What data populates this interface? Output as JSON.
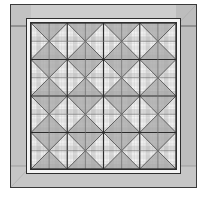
{
  "image": {
    "title": "Framed Quilt Illustration",
    "subject": "quilt-in-frame",
    "width": 207,
    "height": 200,
    "background_color": "#ffffff",
    "style": "grayscale line art"
  },
  "frame": {
    "label": "Picture Frame",
    "fill_color": "#c6c6c6",
    "outline_color": "#3a3a3a",
    "outline_width": 1,
    "highlight_color": "#d6d6d6",
    "shadow_color": "#b0b0b0",
    "rect": {
      "x": 10,
      "y": 4,
      "width": 187,
      "height": 184
    },
    "band_thickness": 22,
    "miter_line_color": "#9a9a9a"
  },
  "mat": {
    "label": "Inner Mat Strip",
    "fill_color": "#f2f2f2",
    "outline_color": "#2e2e2e",
    "rect": {
      "x": 26,
      "y": 18,
      "width": 155,
      "height": 156
    },
    "thickness": 4
  },
  "quilt": {
    "label": "Quilt Panel",
    "rect": {
      "x": 31,
      "y": 23,
      "width": 145,
      "height": 146
    },
    "blocks_across": 4,
    "blocks_down": 4,
    "block_pattern": "hourglass-x-cross",
    "sashing_color": "#2b2b2b",
    "sashing_width": 1.1,
    "diagonal_color": "#585858",
    "diagonal_width": 0.9,
    "triangle_fill": "#a9a9a9",
    "triangle_fill_alt": "#bdbdbd"
  },
  "plaid": {
    "label": "Gingham Background",
    "base_color": "#f4f4f4",
    "light_stripe_color": "#e4e4e4",
    "mid_stripe_color": "#cfcfcf",
    "dark_stripe_color": "#b4b4b4",
    "thin_line_color": "#d8d8d8",
    "stripe_count_across": 16,
    "stripe_count_down": 16,
    "stripe_pattern": [
      "light",
      "base",
      "mid",
      "base",
      "light",
      "base",
      "mid",
      "base"
    ]
  },
  "legend": {
    "frame_name": "frame",
    "mat_name": "mat",
    "quilt_name": "quilt field"
  }
}
